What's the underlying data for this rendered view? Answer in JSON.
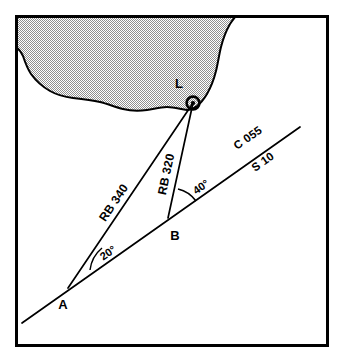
{
  "diagram": {
    "points": [
      {
        "id": "A",
        "label": "A",
        "x": 68,
        "y": 288,
        "role": "first-observation-position"
      },
      {
        "id": "B",
        "label": "B",
        "x": 168,
        "y": 218,
        "role": "second-observation-position"
      },
      {
        "id": "L",
        "label": "L",
        "x": 193,
        "y": 103,
        "role": "lighthouse-landmark"
      }
    ],
    "course": {
      "course_label": "C 055",
      "speed_label": "S 10",
      "start": {
        "x": 22,
        "y": 323
      },
      "end": {
        "x": 300,
        "y": 127
      }
    },
    "bearings": [
      {
        "id": "rb340",
        "label": "RB 340",
        "from": "A",
        "to": "L",
        "angle_label": "20°",
        "angle_value": 20
      },
      {
        "id": "rb320",
        "label": "RB 320",
        "from": "B",
        "to": "L",
        "angle_label": "40°",
        "angle_value": 40
      }
    ],
    "angles": [
      {
        "id": "angle-at-a",
        "label": "20°",
        "vertex": "A",
        "x": 100,
        "y": 256
      },
      {
        "id": "angle-at-b",
        "label": "40°",
        "vertex": "B",
        "x": 196,
        "y": 187
      }
    ],
    "land": {
      "fill_label": "land-stipple",
      "description": "coastline"
    },
    "colors": {
      "ink": "#000000",
      "paper": "#ffffff",
      "land_stipple": "#9a9a9a"
    }
  }
}
